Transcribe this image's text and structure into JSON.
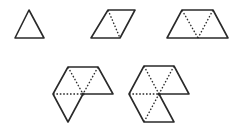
{
  "figure": {
    "colors": {
      "stroke": "#2a2a2a",
      "background": "#ffffff"
    },
    "shapes": [
      {
        "name": "one-triangle",
        "triangles": 1,
        "outline": "29,10 44,38 15,38",
        "dotted": []
      },
      {
        "name": "two-triangles-rhombus",
        "triangles": 2,
        "outline": "108,10 135,10 120,38 91,38",
        "dotted": [
          "108,10 120,38"
        ]
      },
      {
        "name": "three-triangles-trapezoid",
        "triangles": 3,
        "outline": "182,10 213,10 228,38 167,38",
        "dotted": [
          "182,10 198,38",
          "213,10 198,38"
        ]
      },
      {
        "name": "four-triangles",
        "triangles": 4,
        "outline": "68,67 98,67 113,94 83,94 68,122 53,94",
        "dotted": [
          "68,67 83,94",
          "98,67 83,94",
          "53,94 83,94"
        ]
      },
      {
        "name": "five-triangles",
        "triangles": 5,
        "outline": "144,66 174,66 189,94 159,94 174,122 144,122 129,94",
        "dotted": [
          "144,66 159,94",
          "174,66 159,94",
          "129,94 159,94",
          "144,122 159,94"
        ]
      }
    ]
  }
}
